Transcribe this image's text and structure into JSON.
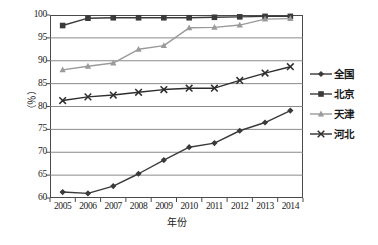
{
  "chart_data": {
    "type": "line",
    "title": "",
    "xlabel": "年份",
    "ylabel": "（％）",
    "categories": [
      "2005",
      "2006",
      "2007",
      "2008",
      "2009",
      "2010",
      "2011",
      "2012",
      "2013",
      "2014"
    ],
    "x": [
      2005,
      2006,
      2007,
      2008,
      2009,
      2010,
      2011,
      2012,
      2013,
      2014
    ],
    "ylim": [
      60,
      100
    ],
    "yticks": [
      60,
      65,
      70,
      75,
      80,
      85,
      90,
      95,
      100
    ],
    "ytick_labels": [
      "60",
      "65",
      "70",
      "75",
      "80",
      "85",
      "90",
      "95",
      "100"
    ],
    "grid": "horizontal",
    "legend_position": "right",
    "series": [
      {
        "name": "全国",
        "marker": "diamond",
        "color": "#3a3a3a",
        "values": [
          61.3,
          61.0,
          62.6,
          65.3,
          68.3,
          71.1,
          72.0,
          74.7,
          76.5,
          79.1
        ]
      },
      {
        "name": "北京",
        "marker": "square",
        "color": "#3a3a3a",
        "values": [
          97.7,
          99.3,
          99.4,
          99.4,
          99.4,
          99.4,
          99.5,
          99.6,
          99.7,
          99.7
        ]
      },
      {
        "name": "天津",
        "marker": "triangle",
        "color": "#9a9a9a",
        "values": [
          88.0,
          88.8,
          89.5,
          92.5,
          93.3,
          97.2,
          97.3,
          97.8,
          99.1,
          99.2
        ]
      },
      {
        "name": "河北",
        "marker": "x",
        "color": "#2e2e2e",
        "values": [
          81.3,
          82.1,
          82.5,
          83.1,
          83.7,
          84.0,
          84.0,
          85.7,
          87.3,
          88.7
        ]
      }
    ]
  },
  "colors": {
    "axis": "#4a4a4a",
    "grid": "#7d7d7d",
    "text": "#1a1a1a",
    "background": "#ffffff"
  }
}
